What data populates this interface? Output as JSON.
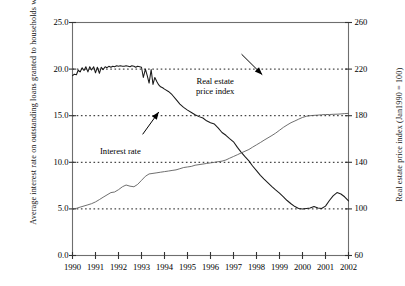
{
  "chart_data": {
    "type": "line",
    "title": "",
    "xlabel": "",
    "ylabel": "Average interest rate on outstanding loans granted to households with maturity of 5 years or longer",
    "ylabel_right": "Real estate price index (Jan1990 = 100)",
    "grid": true,
    "legend_position": "inline-annotations",
    "x_tick_labels": [
      "1990",
      "1991",
      "1992",
      "1993",
      "1994",
      "1995",
      "1996",
      "1997",
      "1998",
      "1999",
      "2000",
      "2001",
      "2002"
    ],
    "x_tick_values": [
      1990,
      1991,
      1992,
      1993,
      1994,
      1995,
      1996,
      1997,
      1998,
      1999,
      2000,
      2001,
      2002
    ],
    "xlim": [
      1990,
      2002
    ],
    "left_axis": {
      "label": "Average interest rate on outstanding loans granted to households with maturity of 5 years or longer",
      "ylim": [
        0.0,
        25.0
      ],
      "ticks": [
        0.0,
        5.0,
        10.0,
        15.0,
        20.0,
        25.0
      ],
      "tick_labels": [
        "0.0",
        "5.0",
        "10.0",
        "15.0",
        "20.0",
        "25.0"
      ],
      "gridlines": [
        5.0,
        10.0,
        15.0,
        20.0
      ]
    },
    "right_axis": {
      "label": "Real estate price index (Jan1990 = 100)",
      "ylim": [
        60,
        260
      ],
      "ticks": [
        60,
        100,
        140,
        180,
        220,
        260
      ],
      "tick_labels": [
        "60",
        "100",
        "140",
        "180",
        "220",
        "260"
      ],
      "gridlines": [
        100,
        140,
        180,
        220
      ]
    },
    "annotations": [
      {
        "name": "interest-rate",
        "line1": "Interest rate",
        "line2": "",
        "arrow_from": [
          1993.05,
          13.0
        ],
        "arrow_to": [
          1993.75,
          15.4
        ]
      },
      {
        "name": "real-estate-price-index",
        "line1": "Real estate",
        "line2": "price index",
        "arrow_from": [
          1997.35,
          21.6
        ],
        "arrow_to": [
          1998.25,
          19.4
        ]
      }
    ],
    "series": [
      {
        "name": "Interest rate",
        "axis": "left",
        "color": "#1a1a1a",
        "x": [
          1990.0,
          1990.08,
          1990.17,
          1990.25,
          1990.33,
          1990.42,
          1990.5,
          1990.58,
          1990.67,
          1990.75,
          1990.83,
          1990.92,
          1991.0,
          1991.08,
          1991.17,
          1991.25,
          1991.33,
          1991.42,
          1991.5,
          1991.58,
          1991.67,
          1991.75,
          1991.83,
          1991.92,
          1992.0,
          1992.08,
          1992.17,
          1992.25,
          1992.33,
          1992.42,
          1992.5,
          1992.58,
          1992.67,
          1992.75,
          1992.83,
          1992.92,
          1993.0,
          1993.08,
          1993.17,
          1993.25,
          1993.33,
          1993.42,
          1993.5,
          1993.58,
          1993.67,
          1993.75,
          1993.83,
          1993.92,
          1994.0,
          1994.17,
          1994.33,
          1994.5,
          1994.67,
          1994.83,
          1995.0,
          1995.17,
          1995.33,
          1995.5,
          1995.67,
          1995.83,
          1996.0,
          1996.17,
          1996.33,
          1996.5,
          1996.67,
          1996.83,
          1997.0,
          1997.17,
          1997.33,
          1997.5,
          1997.67,
          1997.83,
          1998.0,
          1998.17,
          1998.33,
          1998.5,
          1998.67,
          1998.83,
          1999.0,
          1999.17,
          1999.33,
          1999.5,
          1999.67,
          1999.83,
          2000.0,
          2000.17,
          2000.33,
          2000.5,
          2000.67,
          2000.83,
          2001.0,
          2001.17,
          2001.33,
          2001.5,
          2001.67,
          2001.83,
          2002.0
        ],
        "y": [
          19.3,
          19.45,
          19.4,
          19.9,
          19.7,
          20.15,
          19.85,
          20.25,
          19.7,
          20.25,
          19.9,
          20.25,
          19.6,
          20.2,
          19.55,
          20.2,
          19.95,
          20.25,
          20.15,
          20.3,
          20.2,
          20.3,
          20.25,
          20.35,
          20.3,
          20.35,
          20.3,
          20.3,
          20.35,
          20.3,
          20.25,
          20.35,
          20.3,
          20.2,
          20.3,
          20.25,
          20.2,
          19.1,
          20.0,
          19.3,
          18.5,
          19.95,
          18.35,
          19.1,
          18.65,
          18.3,
          18.1,
          18.0,
          17.85,
          17.6,
          17.25,
          16.75,
          16.25,
          15.9,
          15.6,
          15.35,
          15.1,
          14.9,
          14.75,
          14.45,
          14.25,
          14.1,
          13.7,
          13.2,
          12.9,
          12.55,
          12.2,
          11.6,
          11.1,
          10.6,
          10.15,
          9.6,
          9.1,
          8.6,
          8.2,
          7.8,
          7.4,
          7.05,
          6.7,
          6.3,
          5.9,
          5.55,
          5.25,
          5.05,
          5.0,
          5.05,
          5.1,
          5.25,
          5.1,
          5.05,
          5.3,
          5.9,
          6.4,
          6.75,
          6.6,
          6.3,
          5.85
        ]
      },
      {
        "name": "Real estate price index",
        "axis": "right",
        "color": "#555555",
        "x": [
          1990.0,
          1990.17,
          1990.33,
          1990.5,
          1990.67,
          1990.83,
          1991.0,
          1991.17,
          1991.33,
          1991.5,
          1991.67,
          1991.83,
          1992.0,
          1992.17,
          1992.33,
          1992.5,
          1992.67,
          1992.83,
          1993.0,
          1993.17,
          1993.33,
          1993.5,
          1993.67,
          1993.83,
          1994.0,
          1994.17,
          1994.33,
          1994.5,
          1994.67,
          1994.83,
          1995.0,
          1995.17,
          1995.33,
          1995.5,
          1995.67,
          1995.83,
          1996.0,
          1996.17,
          1996.33,
          1996.5,
          1996.67,
          1996.83,
          1997.0,
          1997.17,
          1997.33,
          1997.5,
          1997.67,
          1997.83,
          1998.0,
          1998.17,
          1998.33,
          1998.5,
          1998.67,
          1998.83,
          1999.0,
          1999.17,
          1999.33,
          1999.5,
          1999.67,
          1999.83,
          2000.0,
          2000.17,
          2000.33,
          2000.5,
          2000.67,
          2000.83,
          2001.0,
          2001.17,
          2001.33,
          2001.5,
          2001.67,
          2001.83,
          2002.0
        ],
        "y": [
          100.0,
          100.5,
          101.5,
          102.5,
          103.5,
          104.5,
          106.0,
          108.0,
          110.0,
          112.0,
          114.0,
          114.5,
          116.5,
          119.0,
          120.5,
          119.5,
          119.0,
          121.0,
          124.5,
          128.0,
          130.0,
          130.5,
          131.0,
          131.5,
          132.0,
          132.5,
          133.0,
          133.5,
          134.5,
          135.5,
          136.0,
          136.5,
          137.5,
          138.0,
          138.5,
          139.0,
          139.5,
          140.0,
          140.5,
          141.0,
          142.0,
          143.5,
          145.0,
          146.5,
          148.0,
          149.5,
          151.0,
          153.0,
          155.0,
          157.0,
          159.0,
          161.0,
          163.0,
          165.0,
          167.5,
          170.0,
          172.0,
          174.0,
          175.5,
          177.0,
          178.5,
          179.5,
          180.0,
          180.3,
          180.5,
          180.8,
          181.0,
          181.0,
          181.2,
          181.3,
          181.5,
          181.8,
          182.0
        ]
      }
    ]
  }
}
